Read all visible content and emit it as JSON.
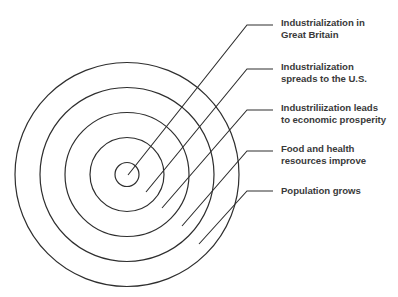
{
  "diagram": {
    "type": "concentric-circles",
    "center": {
      "x": 127,
      "y": 174.5
    },
    "rings": [
      {
        "radius": 112
      },
      {
        "radius": 87
      },
      {
        "radius": 62
      },
      {
        "radius": 37
      },
      {
        "radius": 12
      }
    ],
    "stroke_color": "#2e2e2e",
    "text_color": "#3a3a3a",
    "labels": [
      {
        "lines": [
          "Industrialization in",
          "Great Britain"
        ],
        "ring": "innermost",
        "leader": {
          "start": [
            128,
            175
          ],
          "elbow": [
            247,
            25
          ],
          "end": [
            273,
            25
          ]
        },
        "top": 17
      },
      {
        "lines": [
          "Industrialization",
          "spreads to the U.S."
        ],
        "ring": "second",
        "leader": {
          "start": [
            146,
            192
          ],
          "elbow": [
            247,
            69
          ],
          "end": [
            273,
            69
          ]
        },
        "top": 61
      },
      {
        "lines": [
          "Industriliization leads",
          "to economic prosperity"
        ],
        "ring": "third",
        "leader": {
          "start": [
            162,
            208
          ],
          "elbow": [
            247,
            110
          ],
          "end": [
            273,
            110
          ]
        },
        "top": 102
      },
      {
        "lines": [
          "Food and health",
          "resources improve"
        ],
        "ring": "fourth",
        "leader": {
          "start": [
            182,
            226
          ],
          "elbow": [
            247,
            151
          ],
          "end": [
            273,
            151
          ]
        },
        "top": 143
      },
      {
        "lines": [
          "Population grows"
        ],
        "ring": "outermost",
        "leader": {
          "start": [
            199,
            244
          ],
          "elbow": [
            247,
            191
          ],
          "end": [
            273,
            191
          ]
        },
        "top": 185
      }
    ]
  }
}
